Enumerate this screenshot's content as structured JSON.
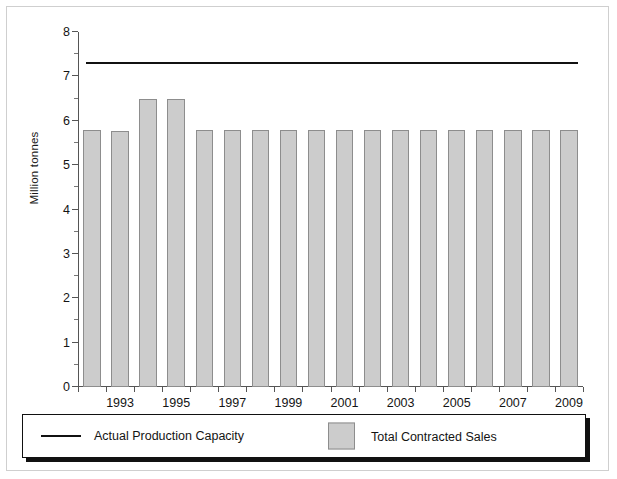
{
  "chart_data": {
    "type": "bar",
    "title": "",
    "xlabel": "",
    "ylabel": "Million tonnes",
    "ylim": [
      0,
      8
    ],
    "ytick_step": 1,
    "yminor_step": 0.5,
    "grid": false,
    "legend_position": "bottom",
    "categories": [
      "1992",
      "1993",
      "1994",
      "1995",
      "1996",
      "1997",
      "1998",
      "1999",
      "2000",
      "2001",
      "2002",
      "2003",
      "2004",
      "2005",
      "2006",
      "2007",
      "2008",
      "2009"
    ],
    "xtick_labels": [
      "1993",
      "1995",
      "1997",
      "1999",
      "2001",
      "2003",
      "2005",
      "2007",
      "2009"
    ],
    "ytick_labels": [
      "0",
      "1",
      "2",
      "3",
      "4",
      "5",
      "6",
      "7",
      "8"
    ],
    "series": [
      {
        "name": "Total Contracted Sales",
        "type": "bar",
        "color": "#cccccc",
        "edge_color": "#8d8d8d",
        "values": [
          5.8,
          5.78,
          6.5,
          6.5,
          5.8,
          5.8,
          5.8,
          5.8,
          5.8,
          5.8,
          5.8,
          5.8,
          5.8,
          5.8,
          5.8,
          5.8,
          5.8,
          5.8
        ]
      },
      {
        "name": "Actual Production Capacity",
        "type": "line",
        "color": "#111111",
        "constant_value": 7.28
      }
    ]
  },
  "axis": {
    "y_title": "Million tonnes"
  },
  "legend": {
    "items": [
      {
        "label": "Actual Production Capacity",
        "marker": "line-swatch"
      },
      {
        "label": "Total Contracted Sales",
        "marker": "box-swatch"
      }
    ]
  }
}
